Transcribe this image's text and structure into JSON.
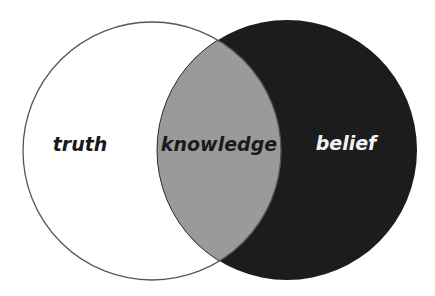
{
  "diagram": {
    "type": "venn",
    "sets": [
      {
        "id": "truth",
        "label": "truth",
        "fill": "#ffffff",
        "stroke": "#555555",
        "text_color": "#1a1a1a"
      },
      {
        "id": "belief",
        "label": "belief",
        "fill": "#1c1c1c",
        "stroke": "#1c1c1c",
        "text_color": "#f2f2f2"
      }
    ],
    "intersection": {
      "id": "knowledge",
      "label": "knowledge",
      "fill": "#9a9a9a",
      "text_color": "#1a1a1a"
    }
  }
}
